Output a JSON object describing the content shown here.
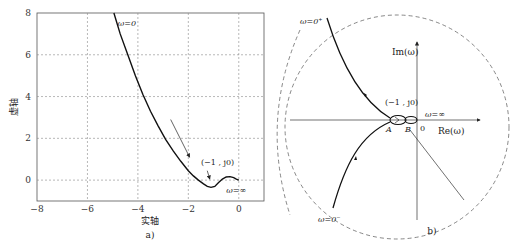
{
  "chart_data": [
    {
      "type": "line",
      "panel_label": "a)",
      "xlabel": "实轴",
      "ylabel": "虚轴",
      "xlim": [
        -8,
        1
      ],
      "ylim": [
        -1,
        8
      ],
      "xticks": [
        -8,
        -6,
        -4,
        -2,
        0
      ],
      "yticks": [
        0,
        2,
        4,
        6,
        8
      ],
      "grid": true,
      "series": [
        {
          "name": "Nyquist curve",
          "x": [
            -4.95,
            -4.7,
            -4.4,
            -4.1,
            -3.8,
            -3.5,
            -3.2,
            -2.9,
            -2.6,
            -2.3,
            -2.0,
            -1.8,
            -1.6,
            -1.4,
            -1.25,
            -1.1,
            -0.95,
            -0.8,
            -0.65,
            -0.5,
            -0.35,
            -0.2,
            -0.1,
            0.0
          ],
          "y": [
            8.0,
            7.0,
            6.0,
            5.0,
            4.1,
            3.3,
            2.6,
            1.95,
            1.4,
            0.9,
            0.45,
            0.2,
            0.0,
            -0.18,
            -0.3,
            -0.35,
            -0.3,
            -0.12,
            0.05,
            0.15,
            0.17,
            0.12,
            0.05,
            0.0
          ]
        }
      ],
      "annotations": [
        {
          "text": "ω=0",
          "x": -4.8,
          "y": 7.4
        },
        {
          "text": "(−1 , j0)",
          "x": -1.5,
          "y": 0.7
        },
        {
          "text": "ω=∞",
          "x": -0.5,
          "y": -0.6
        }
      ],
      "arrows": [
        {
          "from": [
            -2.7,
            2.9
          ],
          "to": [
            -1.95,
            1.1
          ],
          "meaning": "direction of increasing ω"
        },
        {
          "from": [
            -1.25,
            0.45
          ],
          "to": [
            -1.15,
            0.05
          ],
          "meaning": "points to (−1, j0)"
        }
      ]
    },
    {
      "type": "line",
      "panel_label": "b)",
      "xlabel": "Re(ω)",
      "ylabel": "Im(ω)",
      "origin_label": "0",
      "grid": false,
      "annotations": [
        {
          "text": "ω=0⁺"
        },
        {
          "text": "ω=0⁻"
        },
        {
          "text": "(−1 , j0)"
        },
        {
          "text": "ω=∞"
        },
        {
          "text": "A"
        },
        {
          "text": "B"
        }
      ],
      "series": [
        {
          "name": "Nyquist curve (ω>0)",
          "style": "solid"
        },
        {
          "name": "Nyquist curve (ω<0)",
          "style": "solid"
        },
        {
          "name": "Infinite-radius closure arcs",
          "style": "dashed"
        }
      ]
    }
  ]
}
